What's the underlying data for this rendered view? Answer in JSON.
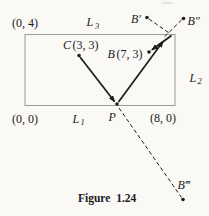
{
  "figure": {
    "caption": "Figure 1.24",
    "colors": {
      "ink": "#1c1c1c",
      "frame": "#9a9a9a",
      "paper": "#faf9f6"
    },
    "labels": {
      "corner_top_left": "(0, 4)",
      "corner_bottom_left": "(0, 0)",
      "corner_bottom_right": "(8, 0)",
      "L": "L",
      "L1_sub": "1",
      "L2_sub": "2",
      "L3_sub": "3",
      "C_letter": "C",
      "C_coords": "(3, 3)",
      "B_letter": "B",
      "B_coords": "(7, 3)",
      "P": "P",
      "B_prime": "B′",
      "B_double_prime": "B″",
      "B_triple_prime": "B‴"
    }
  }
}
